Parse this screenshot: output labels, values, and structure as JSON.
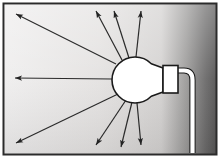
{
  "illustration": {
    "title": "light-bulb-radiating-light",
    "subject": "incandescent light bulb emitting rays of light",
    "canvas": {
      "width": 220,
      "height": 158
    },
    "colors": {
      "border": "#2b2b2b",
      "background_light": "#eceaea",
      "background_mid": "#d9d7d6",
      "background_dark": "#6d6c6c",
      "background_darkest": "#4a4a4a",
      "bulb_fill": "#ffffff",
      "bulb_outline": "#1a1a1a",
      "socket_fill": "#ffffff",
      "socket_outline": "#1a1a1a",
      "cord_fill": "#ffffff",
      "cord_outline": "#1a1a1a",
      "ray": "#2a2a2a"
    },
    "frame": {
      "outer_margin": 3,
      "border_width": 2
    },
    "bulb": {
      "center_x": 135,
      "center_y": 80,
      "radius": 23,
      "neck_half_height": 10,
      "neck_end_x": 163
    },
    "socket": {
      "x": 163,
      "y": 66,
      "width": 15,
      "height": 27
    },
    "cord": {
      "start_x": 178,
      "start_y": 74,
      "corner_x": 190,
      "corner_y": 86,
      "end_y": 152,
      "thickness": 5
    },
    "rays": [
      {
        "name": "ray-upper-left-far",
        "x1": 116,
        "y1": 64,
        "x2": 13,
        "y2": 12
      },
      {
        "name": "ray-upper-left-mid",
        "x1": 122,
        "y1": 60,
        "x2": 95,
        "y2": 8
      },
      {
        "name": "ray-upper-right",
        "x1": 134,
        "y1": 57,
        "x2": 140,
        "y2": 8
      },
      {
        "name": "ray-left-horizontal",
        "x1": 112,
        "y1": 79,
        "x2": 12,
        "y2": 78
      },
      {
        "name": "ray-lower-left-far",
        "x1": 118,
        "y1": 94,
        "x2": 13,
        "y2": 145
      },
      {
        "name": "ray-lower-left-mid",
        "x1": 126,
        "y1": 100,
        "x2": 95,
        "y2": 148
      },
      {
        "name": "ray-lower-right",
        "x1": 136,
        "y1": 103,
        "x2": 140,
        "y2": 148
      },
      {
        "name": "ray-upper-right-high",
        "x1": 128,
        "y1": 58,
        "x2": 113,
        "y2": 8
      },
      {
        "name": "ray-lower-right-low",
        "x1": 132,
        "y1": 103,
        "x2": 120,
        "y2": 150
      }
    ],
    "ray_count": 9,
    "arrowhead": {
      "length": 7,
      "width": 4
    }
  }
}
